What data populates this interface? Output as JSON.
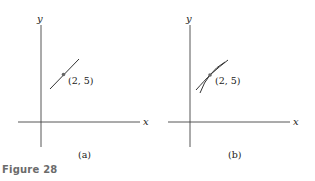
{
  "figure": {
    "caption": "Figure 28",
    "caption_color": "#6b6b6b",
    "line_color": "#333333"
  },
  "panels": [
    {
      "id": "a",
      "label": "(a)",
      "x_axis_label": "x",
      "y_axis_label": "y",
      "point_label": "(2, 5)",
      "description": "Single straight line passing through the point (2, 5)"
    },
    {
      "id": "b",
      "label": "(b)",
      "x_axis_label": "x",
      "y_axis_label": "y",
      "point_label": "(2, 5)",
      "description": "Two curves crossing at the point (2, 5)"
    }
  ]
}
